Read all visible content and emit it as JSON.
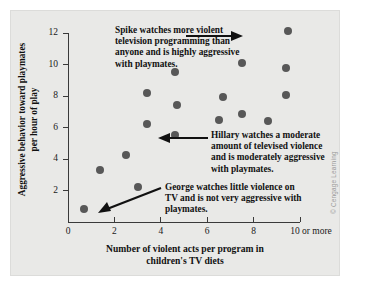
{
  "figure": {
    "credit": "© Cengage Learning",
    "background_color": "#e9e9e7",
    "dot_color": "#585858",
    "axis_color": "#3a3a3a"
  },
  "chart_data": {
    "type": "scatter",
    "title": "",
    "xlabel": "Number of violent acts per program in children's TV diets",
    "xlabel_line1": "Number of violent acts per program in",
    "xlabel_line2": "children's TV diets",
    "ylabel": "Aggressive behavior toward playmates per hour of play",
    "ylabel_line1": "Aggressive behavior toward playmates",
    "ylabel_line2": "per hour of play",
    "xlim": [
      0,
      10
    ],
    "ylim": [
      0,
      12
    ],
    "grid": false,
    "legend": "none",
    "xticks": [
      0,
      2,
      4,
      6,
      8,
      10
    ],
    "xtick_labels": [
      "0",
      "2",
      "4",
      "6",
      "8",
      "10 or more"
    ],
    "yticks": [
      2,
      4,
      6,
      8,
      10,
      12
    ],
    "ytick_labels": [
      "2",
      "4",
      "6",
      "8",
      "10",
      "12"
    ],
    "points": [
      {
        "x": 0.7,
        "y": 0.8,
        "label": "George"
      },
      {
        "x": 1.4,
        "y": 3.3,
        "label": ""
      },
      {
        "x": 2.5,
        "y": 4.25,
        "label": ""
      },
      {
        "x": 3.0,
        "y": 2.25,
        "label": ""
      },
      {
        "x": 3.4,
        "y": 8.2,
        "label": ""
      },
      {
        "x": 3.4,
        "y": 6.2,
        "label": ""
      },
      {
        "x": 4.6,
        "y": 9.5,
        "label": ""
      },
      {
        "x": 4.7,
        "y": 7.4,
        "label": ""
      },
      {
        "x": 4.6,
        "y": 5.5,
        "label": "Hillary"
      },
      {
        "x": 6.5,
        "y": 6.5,
        "label": ""
      },
      {
        "x": 6.7,
        "y": 7.95,
        "label": ""
      },
      {
        "x": 7.5,
        "y": 10.1,
        "label": ""
      },
      {
        "x": 7.5,
        "y": 6.85,
        "label": ""
      },
      {
        "x": 8.6,
        "y": 6.4,
        "label": ""
      },
      {
        "x": 9.4,
        "y": 9.75,
        "label": ""
      },
      {
        "x": 9.4,
        "y": 8.05,
        "label": ""
      },
      {
        "x": 9.5,
        "y": 12.1,
        "label": "Spike"
      }
    ],
    "annotations": [
      {
        "name": "spike",
        "text": "Spike watches more violent television programming than anyone and is highly aggressive with playmates.",
        "lines": [
          "Spike watches more violent",
          "television programming than",
          "anyone and is highly aggressive",
          "with playmates."
        ],
        "points_to": {
          "x": 9.5,
          "y": 12.1
        }
      },
      {
        "name": "hillary",
        "text": "Hillary watches a moderate amount of televised violence and is moderately aggressive with playmates.",
        "lines": [
          "Hillary watches a moderate",
          "amount of televised violence",
          "and is moderately aggressive",
          "with playmates."
        ],
        "points_to": {
          "x": 4.6,
          "y": 5.5
        }
      },
      {
        "name": "george",
        "text": "George watches little violence on TV and is not very aggressive with playmates.",
        "lines": [
          "George watches little violence on",
          "TV and is not very aggressive with",
          "playmates."
        ],
        "points_to": {
          "x": 0.7,
          "y": 0.8
        }
      }
    ]
  }
}
